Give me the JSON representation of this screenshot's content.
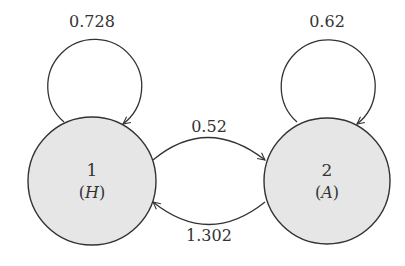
{
  "diagram": {
    "type": "state-transition",
    "colors": {
      "node_fill": "#e6e6e6",
      "stroke": "#333333",
      "text": "#333333"
    },
    "nodes": [
      {
        "id": "1",
        "number": "1",
        "label_open": "(",
        "label_var": "H",
        "label_close": ")"
      },
      {
        "id": "2",
        "number": "2",
        "label_open": "(",
        "label_var": "A",
        "label_close": ")"
      }
    ],
    "edges": [
      {
        "from": "1",
        "to": "1",
        "label": "0.728"
      },
      {
        "from": "2",
        "to": "2",
        "label": "0.62"
      },
      {
        "from": "1",
        "to": "2",
        "label": "0.52"
      },
      {
        "from": "2",
        "to": "1",
        "label": "1.302"
      }
    ]
  }
}
